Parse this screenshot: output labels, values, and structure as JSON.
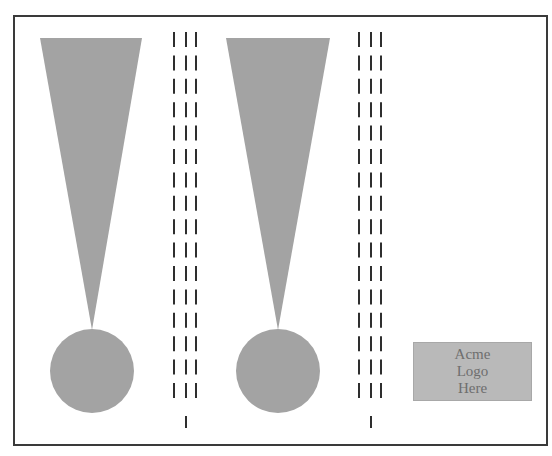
{
  "diagram": {
    "frame": {
      "x": 13,
      "y": 15,
      "width": 533,
      "height": 429,
      "stroke": "#3a3a3a"
    },
    "shape_color": "#a3a3a3",
    "dash_color": "#2e2e2e",
    "exclamation_marks": [
      {
        "triangle": {
          "top_left_x": 40,
          "top_right_x": 142,
          "top_y": 38,
          "apex_x": 92,
          "apex_y": 330
        },
        "circle": {
          "cx": 92,
          "cy": 371,
          "r": 42
        }
      },
      {
        "triangle": {
          "top_left_x": 226,
          "top_right_x": 330,
          "top_y": 38,
          "apex_x": 278,
          "apex_y": 330
        },
        "circle": {
          "cx": 278,
          "cy": 371,
          "r": 42
        }
      }
    ],
    "dash_columns": [
      {
        "lines_x": [
          174,
          186,
          196
        ],
        "single_x": 186
      },
      {
        "lines_x": [
          359,
          371,
          381
        ],
        "single_x": 371
      }
    ],
    "dash_pattern": {
      "start_y": 32,
      "dash_length": 15,
      "period": 23.4,
      "rows": 16,
      "single_start_y": 416,
      "single_length": 12,
      "stroke_width": 2
    },
    "logo": {
      "lines": [
        "Acme",
        "Logo",
        "Here"
      ],
      "background": "#b9b9b9",
      "text_color": "#6e6e6e"
    }
  }
}
